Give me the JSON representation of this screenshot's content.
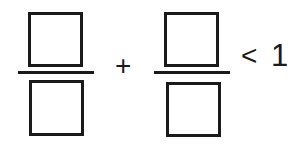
{
  "expression": {
    "description": "Fill-in-the-blank inequality with two fractions",
    "left_fraction": {
      "numerator": "",
      "denominator": ""
    },
    "operator": "+",
    "right_fraction": {
      "numerator": "",
      "denominator": ""
    },
    "comparison": "<",
    "rhs": "1"
  },
  "colors": {
    "ink": "#1a1a1a",
    "background": "#ffffff"
  }
}
